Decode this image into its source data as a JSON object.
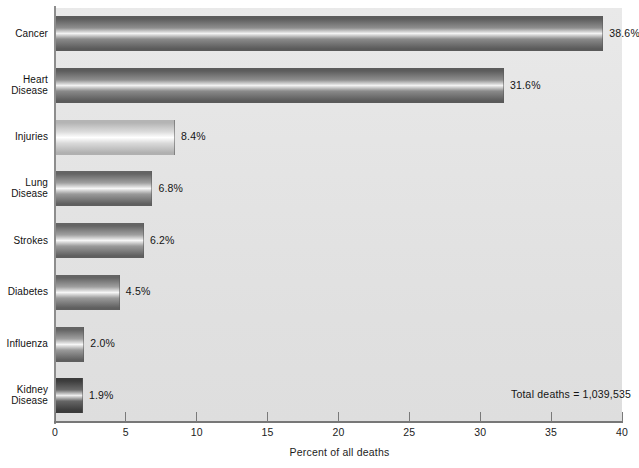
{
  "chart_data": {
    "type": "bar",
    "orientation": "horizontal",
    "title": "",
    "xlabel": "Percent of all deaths",
    "ylabel": "",
    "xlim": [
      0,
      40
    ],
    "xticks": [
      0,
      5,
      10,
      15,
      20,
      25,
      30,
      35,
      40
    ],
    "xtick_labels": [
      "0",
      "5",
      "10",
      "15",
      "20",
      "25",
      "30",
      "35",
      "40"
    ],
    "grid": false,
    "legend": null,
    "categories": [
      "Cancer",
      "Heart Disease",
      "Injuries",
      "Lung Disease",
      "Strokes",
      "Diabetes",
      "Influenza",
      "Kidney Disease"
    ],
    "values": [
      38.6,
      31.6,
      8.4,
      6.8,
      6.2,
      4.5,
      2.0,
      1.9
    ],
    "value_labels": [
      "38.6%",
      "31.6%",
      "8.4%",
      "6.8%",
      "6.2%",
      "4.5%",
      "2.0%",
      "1.9%"
    ],
    "annotations": [
      "Total deaths = 1,039,535"
    ]
  },
  "axis": {
    "x_title": "Percent of all deaths",
    "ticks": [
      {
        "label": "0",
        "value": 0
      },
      {
        "label": "5",
        "value": 5
      },
      {
        "label": "10",
        "value": 10
      },
      {
        "label": "15",
        "value": 15
      },
      {
        "label": "20",
        "value": 20
      },
      {
        "label": "25",
        "value": 25
      },
      {
        "label": "30",
        "value": 30
      },
      {
        "label": "35",
        "value": 35
      },
      {
        "label": "40",
        "value": 40
      }
    ]
  },
  "bars": [
    {
      "name": "cancer",
      "label_line1": "Cancer",
      "label_line2": "",
      "value": 38.6,
      "value_label": "38.6%",
      "shade": "dark"
    },
    {
      "name": "heart-disease",
      "label_line1": "Heart",
      "label_line2": "Disease",
      "value": 31.6,
      "value_label": "31.6%",
      "shade": "dark"
    },
    {
      "name": "injuries",
      "label_line1": "Injuries",
      "label_line2": "",
      "value": 8.4,
      "value_label": "8.4%",
      "shade": "light"
    },
    {
      "name": "lung-disease",
      "label_line1": "Lung",
      "label_line2": "Disease",
      "value": 6.8,
      "value_label": "6.8%",
      "shade": "medium"
    },
    {
      "name": "strokes",
      "label_line1": "Strokes",
      "label_line2": "",
      "value": 6.2,
      "value_label": "6.2%",
      "shade": "medium"
    },
    {
      "name": "diabetes",
      "label_line1": "Diabetes",
      "label_line2": "",
      "value": 4.5,
      "value_label": "4.5%",
      "shade": "medium"
    },
    {
      "name": "influenza",
      "label_line1": "Influenza",
      "label_line2": "",
      "value": 2.0,
      "value_label": "2.0%",
      "shade": "medium"
    },
    {
      "name": "kidney-disease",
      "label_line1": "Kidney",
      "label_line2": "Disease",
      "value": 1.9,
      "value_label": "1.9%",
      "shade": "darkest"
    }
  ],
  "note": {
    "total_deaths": "Total deaths = 1,039,535"
  },
  "colors": {
    "plot_background": "#e4e4e4",
    "axis_line": "#7a7a7a",
    "text": "#141414",
    "bar_dark": "#6e6e6e",
    "bar_light": "#d6d6d6",
    "bar_medium": "#8f8f8f",
    "bar_darkest": "#5a5a5a"
  }
}
